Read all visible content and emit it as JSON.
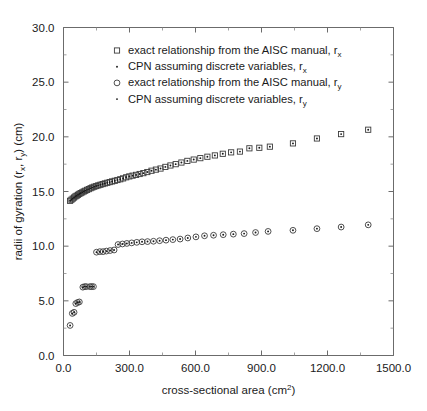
{
  "chart_data": {
    "type": "scatter",
    "title": "",
    "xlabel": "cross-sectional area (cm2)",
    "xlabel_base": "cross-sectional area (cm",
    "xlabel_sup": "2",
    "xlabel_tail": ")",
    "ylabel_base": "radii of gyration (r",
    "ylabel_sub1": "x",
    "ylabel_mid": ", r",
    "ylabel_sub2": "y",
    "ylabel_tail": ") (cm)",
    "ylabel": "radii of gyration (rx, ry) (cm)",
    "xlim": [
      0,
      1500
    ],
    "ylim": [
      0,
      30
    ],
    "xticks": [
      0,
      300,
      600,
      900,
      1200,
      1500
    ],
    "xticklabels": [
      "0.0",
      "300.0",
      "600.0",
      "900.0",
      "1200.0",
      "1500.0"
    ],
    "yticks": [
      0,
      5,
      10,
      15,
      20,
      25,
      30
    ],
    "yticklabels": [
      "0.0",
      "5.0",
      "10.0",
      "15.0",
      "20.0",
      "25.0",
      "30.0"
    ],
    "xminor_step": 150,
    "yminor_step": 2.5,
    "grid": false,
    "legend_position": "upper-center",
    "legend": [
      {
        "marker": "square-open",
        "label_base": "exact relationship from the AISC manual, r",
        "label_sub": "x"
      },
      {
        "marker": "dot",
        "label_base": "CPN assuming discrete variables, r",
        "label_sub": "x"
      },
      {
        "marker": "circle-open",
        "label_base": "exact relationship from the AISC manual, r",
        "label_sub": "y"
      },
      {
        "marker": "dot",
        "label_base": "CPN assuming discrete variables, r",
        "label_sub": "y"
      }
    ],
    "series": [
      {
        "name": "exact relationship from the AISC manual, r_x",
        "marker": "square-open",
        "x": [
          30,
          36,
          42,
          48,
          54,
          60,
          66,
          72,
          78,
          85,
          92,
          99,
          107,
          115,
          123,
          131,
          140,
          149,
          158,
          168,
          178,
          188,
          199,
          210,
          221,
          233,
          245,
          258,
          271,
          285,
          299,
          314,
          330,
          346,
          363,
          381,
          400,
          420,
          441,
          463,
          486,
          510,
          536,
          563,
          592,
          622,
          654,
          688,
          724,
          762,
          802,
          845,
          890,
          938,
          1043,
          1152,
          1262,
          1385
        ],
        "y": [
          14.15,
          14.25,
          14.35,
          14.45,
          14.55,
          14.62,
          14.7,
          14.78,
          14.85,
          14.92,
          15.0,
          15.07,
          15.15,
          15.22,
          15.3,
          15.37,
          15.44,
          15.5,
          15.56,
          15.62,
          15.68,
          15.74,
          15.8,
          15.86,
          15.92,
          15.98,
          16.05,
          16.12,
          16.2,
          16.3,
          16.38,
          16.45,
          16.52,
          16.6,
          16.68,
          16.78,
          16.9,
          17.0,
          17.1,
          17.25,
          17.38,
          17.5,
          17.65,
          17.8,
          17.92,
          18.05,
          18.18,
          18.3,
          18.45,
          18.58,
          18.65,
          18.95,
          19.0,
          19.1,
          19.4,
          19.85,
          20.25,
          20.65
        ]
      },
      {
        "name": "CPN assuming discrete variables, r_x",
        "marker": "dot",
        "x": [
          30,
          36,
          42,
          48,
          54,
          60,
          66,
          72,
          78,
          85,
          92,
          99,
          107,
          115,
          123,
          131,
          140,
          149,
          158,
          168,
          178,
          188,
          199,
          210,
          221,
          233,
          245,
          258,
          271,
          285,
          299,
          314,
          330,
          346,
          363,
          381,
          400,
          420,
          441,
          463,
          486,
          510,
          536,
          563,
          592,
          622,
          654,
          688,
          724,
          762,
          802,
          845,
          890,
          938,
          1043,
          1152,
          1262,
          1385
        ],
        "y": [
          14.15,
          14.25,
          14.35,
          14.45,
          14.55,
          14.62,
          14.7,
          14.78,
          14.85,
          14.92,
          15.0,
          15.07,
          15.15,
          15.22,
          15.3,
          15.37,
          15.44,
          15.5,
          15.56,
          15.62,
          15.68,
          15.74,
          15.8,
          15.86,
          15.92,
          15.98,
          16.05,
          16.12,
          16.2,
          16.3,
          16.38,
          16.45,
          16.52,
          16.6,
          16.68,
          16.78,
          16.9,
          17.0,
          17.1,
          17.25,
          17.38,
          17.5,
          17.65,
          17.8,
          17.92,
          18.05,
          18.18,
          18.3,
          18.45,
          18.58,
          18.65,
          18.95,
          19.0,
          19.1,
          19.4,
          19.85,
          20.25,
          20.65
        ]
      },
      {
        "name": "exact relationship from the AISC manual, r_y",
        "marker": "circle-open",
        "x": [
          30,
          40,
          48,
          56,
          64,
          72,
          88,
          96,
          104,
          120,
          128,
          136,
          150,
          165,
          180,
          195,
          212,
          230,
          248,
          268,
          288,
          310,
          333,
          357,
          382,
          409,
          437,
          466,
          497,
          530,
          565,
          602,
          641,
          682,
          726,
          772,
          821,
          873,
          930,
          1043,
          1152,
          1262,
          1385
        ],
        "y": [
          2.75,
          3.85,
          3.95,
          4.75,
          4.85,
          4.9,
          6.25,
          6.3,
          6.3,
          6.3,
          6.3,
          6.3,
          9.45,
          9.5,
          9.5,
          9.55,
          9.6,
          9.65,
          10.15,
          10.2,
          10.25,
          10.3,
          10.35,
          10.4,
          10.42,
          10.45,
          10.5,
          10.55,
          10.6,
          10.65,
          10.75,
          10.85,
          10.95,
          11.0,
          11.05,
          11.1,
          11.15,
          11.25,
          11.35,
          11.45,
          11.6,
          11.75,
          11.95
        ]
      },
      {
        "name": "CPN assuming discrete variables, r_y",
        "marker": "dot",
        "x": [
          30,
          40,
          48,
          56,
          64,
          72,
          88,
          96,
          104,
          120,
          128,
          136,
          150,
          165,
          180,
          195,
          212,
          230,
          248,
          268,
          288,
          310,
          333,
          357,
          382,
          409,
          437,
          466,
          497,
          530,
          565,
          602,
          641,
          682,
          726,
          772,
          821,
          873,
          930,
          1043,
          1152,
          1262,
          1385
        ],
        "y": [
          2.75,
          3.85,
          3.95,
          4.75,
          4.85,
          4.9,
          6.25,
          6.3,
          6.3,
          6.3,
          6.3,
          6.3,
          9.45,
          9.5,
          9.5,
          9.55,
          9.6,
          9.65,
          10.15,
          10.2,
          10.25,
          10.3,
          10.35,
          10.4,
          10.42,
          10.45,
          10.5,
          10.55,
          10.6,
          10.65,
          10.75,
          10.85,
          10.95,
          11.0,
          11.05,
          11.1,
          11.15,
          11.25,
          11.35,
          11.45,
          11.6,
          11.75,
          11.95
        ]
      }
    ]
  },
  "colors": {
    "marker_stroke": "#3b3b3b",
    "dot_fill": "#1a1a1a",
    "axis": "#6b6b6b",
    "background": "#ffffff"
  }
}
